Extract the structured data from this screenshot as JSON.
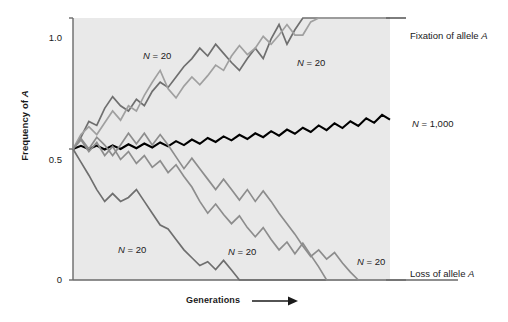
{
  "chart_data": {
    "type": "line",
    "title": "",
    "xlabel": "Generations",
    "ylabel": "Frequency of A",
    "xlim": [
      0,
      40
    ],
    "ylim": [
      0,
      1.0
    ],
    "yticks": [
      0,
      0.5,
      1.0
    ],
    "ytick_labels": [
      "0",
      "0.5",
      "1.0"
    ],
    "xticks": [],
    "grid": false,
    "legend_position": "right-inline",
    "plot_background": "#e9e9e9",
    "annotations": [
      {
        "text": "Fixation of allele A",
        "x_px": 410,
        "y_px": 36
      },
      {
        "text": "N = 1,000",
        "x_px": 412,
        "y_px": 124
      },
      {
        "text": "Loss of allele A",
        "x_px": 410,
        "y_px": 274
      },
      {
        "text": "N = 20",
        "x_px": 143,
        "y_px": 56
      },
      {
        "text": "N = 20",
        "x_px": 297,
        "y_px": 63
      },
      {
        "text": "N = 20",
        "x_px": 118,
        "y_px": 250
      },
      {
        "text": "N = 20",
        "x_px": 228,
        "y_px": 252
      },
      {
        "text": "N = 20",
        "x_px": 357,
        "y_px": 262
      }
    ],
    "series": [
      {
        "name": "N = 20 (fixation, dark gray)",
        "color": "#6f6f6f",
        "width": 1.7,
        "points": [
          [
            0,
            0.5
          ],
          [
            1,
            0.545
          ],
          [
            2,
            0.605
          ],
          [
            3,
            0.59
          ],
          [
            4,
            0.655
          ],
          [
            5,
            0.7
          ],
          [
            6,
            0.665
          ],
          [
            7,
            0.645
          ],
          [
            8,
            0.69
          ],
          [
            9,
            0.665
          ],
          [
            10,
            0.72
          ],
          [
            11,
            0.755
          ],
          [
            12,
            0.735
          ],
          [
            13,
            0.775
          ],
          [
            14,
            0.815
          ],
          [
            15,
            0.845
          ],
          [
            16,
            0.885
          ],
          [
            17,
            0.855
          ],
          [
            18,
            0.9
          ],
          [
            19,
            0.865
          ],
          [
            20,
            0.83
          ],
          [
            21,
            0.8
          ],
          [
            22,
            0.845
          ],
          [
            23,
            0.885
          ],
          [
            24,
            0.845
          ],
          [
            25,
            0.92
          ],
          [
            26,
            0.975
          ],
          [
            27,
            0.9
          ],
          [
            28,
            0.955
          ],
          [
            29,
            1.0
          ],
          [
            30,
            1.0
          ],
          [
            31,
            1.0
          ],
          [
            32,
            1.0
          ],
          [
            33,
            1.0
          ],
          [
            34,
            1.0
          ],
          [
            35,
            1.0
          ],
          [
            36,
            1.0
          ],
          [
            37,
            1.0
          ],
          [
            38,
            1.0
          ],
          [
            39,
            1.0
          ],
          [
            40,
            1.0
          ]
        ]
      },
      {
        "name": "N = 20 (fixation, light gray)",
        "color": "#a0a0a0",
        "width": 1.7,
        "points": [
          [
            0,
            0.5
          ],
          [
            1,
            0.555
          ],
          [
            2,
            0.585
          ],
          [
            3,
            0.555
          ],
          [
            4,
            0.6
          ],
          [
            5,
            0.645
          ],
          [
            6,
            0.61
          ],
          [
            7,
            0.665
          ],
          [
            8,
            0.645
          ],
          [
            9,
            0.705
          ],
          [
            10,
            0.755
          ],
          [
            11,
            0.8
          ],
          [
            12,
            0.73
          ],
          [
            13,
            0.695
          ],
          [
            14,
            0.74
          ],
          [
            15,
            0.775
          ],
          [
            16,
            0.745
          ],
          [
            17,
            0.78
          ],
          [
            18,
            0.82
          ],
          [
            19,
            0.8
          ],
          [
            20,
            0.855
          ],
          [
            21,
            0.895
          ],
          [
            22,
            0.86
          ],
          [
            23,
            0.885
          ],
          [
            24,
            0.93
          ],
          [
            25,
            0.9
          ],
          [
            26,
            0.935
          ],
          [
            27,
            0.975
          ],
          [
            28,
            0.935
          ],
          [
            29,
            0.935
          ],
          [
            30,
            0.985
          ],
          [
            31,
            1.0
          ],
          [
            32,
            1.0
          ],
          [
            33,
            1.0
          ],
          [
            34,
            1.0
          ],
          [
            35,
            1.0
          ],
          [
            36,
            1.0
          ],
          [
            37,
            1.0
          ],
          [
            38,
            1.0
          ],
          [
            39,
            1.0
          ],
          [
            40,
            1.0
          ]
        ]
      },
      {
        "name": "N = 1,000 (black)",
        "color": "#000000",
        "width": 2.1,
        "points": [
          [
            0,
            0.5
          ],
          [
            1,
            0.512
          ],
          [
            2,
            0.5
          ],
          [
            3,
            0.513
          ],
          [
            4,
            0.498
          ],
          [
            5,
            0.514
          ],
          [
            6,
            0.5
          ],
          [
            7,
            0.518
          ],
          [
            8,
            0.503
          ],
          [
            9,
            0.521
          ],
          [
            10,
            0.506
          ],
          [
            11,
            0.525
          ],
          [
            12,
            0.51
          ],
          [
            13,
            0.53
          ],
          [
            14,
            0.515
          ],
          [
            15,
            0.536
          ],
          [
            16,
            0.52
          ],
          [
            17,
            0.542
          ],
          [
            18,
            0.527
          ],
          [
            19,
            0.548
          ],
          [
            20,
            0.533
          ],
          [
            21,
            0.554
          ],
          [
            22,
            0.538
          ],
          [
            23,
            0.56
          ],
          [
            24,
            0.545
          ],
          [
            25,
            0.568
          ],
          [
            26,
            0.551
          ],
          [
            27,
            0.574
          ],
          [
            28,
            0.558
          ],
          [
            29,
            0.581
          ],
          [
            30,
            0.565
          ],
          [
            31,
            0.59
          ],
          [
            32,
            0.572
          ],
          [
            33,
            0.598
          ],
          [
            34,
            0.58
          ],
          [
            35,
            0.606
          ],
          [
            36,
            0.588
          ],
          [
            37,
            0.617
          ],
          [
            38,
            0.6
          ],
          [
            39,
            0.63
          ],
          [
            40,
            0.612
          ]
        ]
      },
      {
        "name": "N = 20 (loss, early)",
        "color": "#6f6f6f",
        "width": 1.7,
        "points": [
          [
            0,
            0.5
          ],
          [
            1,
            0.45
          ],
          [
            2,
            0.4
          ],
          [
            3,
            0.345
          ],
          [
            4,
            0.3
          ],
          [
            5,
            0.33
          ],
          [
            6,
            0.3
          ],
          [
            7,
            0.315
          ],
          [
            8,
            0.345
          ],
          [
            9,
            0.3
          ],
          [
            10,
            0.255
          ],
          [
            11,
            0.21
          ],
          [
            12,
            0.195
          ],
          [
            13,
            0.155
          ],
          [
            14,
            0.115
          ],
          [
            15,
            0.085
          ],
          [
            16,
            0.055
          ],
          [
            17,
            0.07
          ],
          [
            18,
            0.04
          ],
          [
            19,
            0.075
          ],
          [
            20,
            0.038
          ],
          [
            21,
            0.0
          ],
          [
            22,
            0.0
          ],
          [
            23,
            0.0
          ],
          [
            24,
            0.0
          ],
          [
            25,
            0.0
          ],
          [
            26,
            0.0
          ],
          [
            27,
            0.0
          ],
          [
            28,
            0.0
          ],
          [
            29,
            0.0
          ],
          [
            30,
            0.0
          ],
          [
            31,
            0.0
          ],
          [
            32,
            0.0
          ],
          [
            33,
            0.0
          ],
          [
            34,
            0.0
          ],
          [
            35,
            0.0
          ],
          [
            36,
            0.0
          ],
          [
            37,
            0.0
          ],
          [
            38,
            0.0
          ],
          [
            39,
            0.0
          ],
          [
            40,
            0.0
          ]
        ]
      },
      {
        "name": "N = 20 (loss, mid)",
        "color": "#8d8d8d",
        "width": 1.7,
        "points": [
          [
            0,
            0.5
          ],
          [
            1,
            0.535
          ],
          [
            2,
            0.49
          ],
          [
            3,
            0.525
          ],
          [
            4,
            0.475
          ],
          [
            5,
            0.51
          ],
          [
            6,
            0.46
          ],
          [
            7,
            0.49
          ],
          [
            8,
            0.445
          ],
          [
            9,
            0.475
          ],
          [
            10,
            0.43
          ],
          [
            11,
            0.455
          ],
          [
            12,
            0.41
          ],
          [
            13,
            0.44
          ],
          [
            14,
            0.395
          ],
          [
            15,
            0.355
          ],
          [
            16,
            0.3
          ],
          [
            17,
            0.255
          ],
          [
            18,
            0.29
          ],
          [
            19,
            0.25
          ],
          [
            20,
            0.215
          ],
          [
            21,
            0.245
          ],
          [
            22,
            0.2
          ],
          [
            23,
            0.165
          ],
          [
            24,
            0.2
          ],
          [
            25,
            0.155
          ],
          [
            26,
            0.115
          ],
          [
            27,
            0.145
          ],
          [
            28,
            0.1
          ],
          [
            29,
            0.14
          ],
          [
            30,
            0.095
          ],
          [
            31,
            0.05
          ],
          [
            32,
            0.0
          ],
          [
            33,
            0.0
          ],
          [
            34,
            0.0
          ],
          [
            35,
            0.0
          ],
          [
            36,
            0.0
          ],
          [
            37,
            0.0
          ],
          [
            38,
            0.0
          ],
          [
            39,
            0.0
          ],
          [
            40,
            0.0
          ]
        ]
      },
      {
        "name": "N = 20 (loss, late)",
        "color": "#8d8d8d",
        "width": 1.7,
        "points": [
          [
            0,
            0.5
          ],
          [
            1,
            0.54
          ],
          [
            2,
            0.5
          ],
          [
            3,
            0.545
          ],
          [
            4,
            0.515
          ],
          [
            5,
            0.475
          ],
          [
            6,
            0.515
          ],
          [
            7,
            0.56
          ],
          [
            8,
            0.52
          ],
          [
            9,
            0.56
          ],
          [
            10,
            0.515
          ],
          [
            11,
            0.555
          ],
          [
            12,
            0.515
          ],
          [
            13,
            0.47
          ],
          [
            14,
            0.425
          ],
          [
            15,
            0.465
          ],
          [
            16,
            0.425
          ],
          [
            17,
            0.385
          ],
          [
            18,
            0.345
          ],
          [
            19,
            0.385
          ],
          [
            20,
            0.345
          ],
          [
            21,
            0.305
          ],
          [
            22,
            0.345
          ],
          [
            23,
            0.3
          ],
          [
            24,
            0.34
          ],
          [
            25,
            0.3
          ],
          [
            26,
            0.255
          ],
          [
            27,
            0.215
          ],
          [
            28,
            0.175
          ],
          [
            29,
            0.13
          ],
          [
            30,
            0.09
          ],
          [
            31,
            0.115
          ],
          [
            32,
            0.08
          ],
          [
            33,
            0.105
          ],
          [
            34,
            0.065
          ],
          [
            35,
            0.03
          ],
          [
            36,
            0.0
          ],
          [
            37,
            0.0
          ],
          [
            38,
            0.0
          ],
          [
            39,
            0.0
          ],
          [
            40,
            0.0
          ]
        ]
      }
    ]
  },
  "axes": {
    "ylabel_prefix": "Frequency of ",
    "ylabel_italic": "A",
    "xlabel": "Generations",
    "ytick_0": "0",
    "ytick_half": "0.5",
    "ytick_one": "1.0"
  },
  "labels": {
    "fixation_prefix": "Fixation of allele ",
    "fixation_italic": "A",
    "loss_prefix": "Loss of allele ",
    "loss_italic": "A",
    "n_small": "N",
    "n_small_value": " = 20",
    "n_large": "N",
    "n_large_value": " = 1,000"
  },
  "colors": {
    "plot_bg": "#e9e9e9",
    "axis": "#6a6a6a",
    "black_line": "#000000",
    "dark_gray_line": "#6f6f6f",
    "mid_gray_line": "#8d8d8d",
    "light_gray_line": "#a0a0a0",
    "text": "#1a1a1a"
  }
}
